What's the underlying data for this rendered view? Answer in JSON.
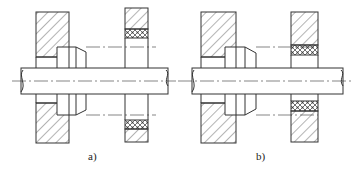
{
  "figure": {
    "panels": [
      {
        "id": "a",
        "label": "a)",
        "description": "Shaft passing through housing wall with collar; separate plate with packing rings away from shaft"
      },
      {
        "id": "b",
        "label": "b)",
        "description": "Shaft passing through housing wall with collar; separate plate with packing rings adjacent to shaft"
      }
    ],
    "colors": {
      "line": "#333333",
      "background": "#ffffff"
    }
  }
}
